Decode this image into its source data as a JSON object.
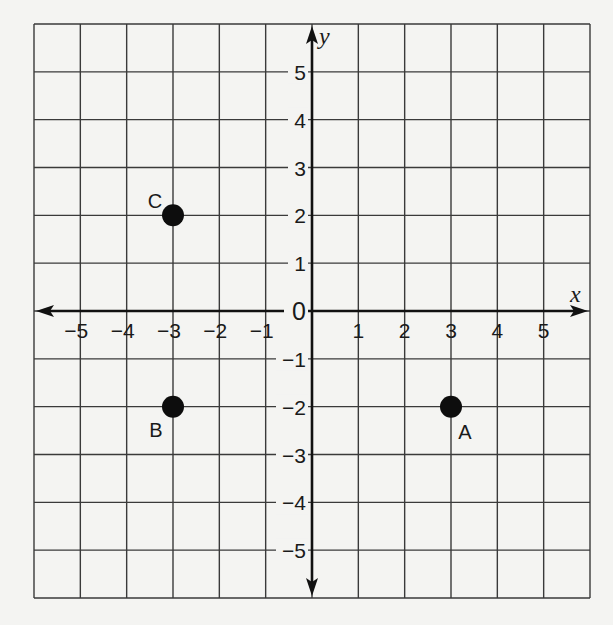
{
  "chart_data": {
    "type": "scatter",
    "title": "",
    "xlabel": "x",
    "ylabel": "y",
    "xlim": [
      -6,
      6
    ],
    "ylim": [
      -6,
      6
    ],
    "grid": true,
    "x_ticks": [
      -5,
      -4,
      -3,
      -2,
      -1,
      1,
      2,
      3,
      4,
      5
    ],
    "y_ticks": [
      -5,
      -4,
      -3,
      -2,
      -1,
      1,
      2,
      3,
      4,
      5
    ],
    "origin_label": "0",
    "points": [
      {
        "label": "C",
        "x": -3,
        "y": 2,
        "label_pos": "upper-left"
      },
      {
        "label": "B",
        "x": -3,
        "y": -2,
        "label_pos": "lower-left"
      },
      {
        "label": "A",
        "x": 3,
        "y": -2,
        "label_pos": "lower-right"
      }
    ],
    "colors": {
      "grid": "#3a3a3a",
      "axis": "#111111",
      "point": "#0d0d0d",
      "background": "#f4f4f2"
    }
  },
  "layout": {
    "left": 34,
    "right": 590,
    "top": 24,
    "bottom": 598
  }
}
